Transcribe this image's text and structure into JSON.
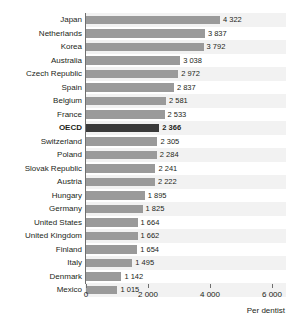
{
  "chart_data": {
    "type": "bar",
    "orientation": "horizontal",
    "title": "",
    "subtitle": "",
    "xlabel": "Per dentist",
    "ylabel": "",
    "xlim": [
      0,
      6000
    ],
    "xticks": [
      0,
      2000,
      4000,
      6000
    ],
    "xtick_labels": [
      "0",
      "2 000",
      "4 000",
      "6 000"
    ],
    "grid": false,
    "legend": null,
    "highlight_category": "OECD",
    "highlight_color": "#3a3a3a",
    "bar_color": "#9a9a9a",
    "band_color": "#f2f2f2",
    "categories": [
      "Japan",
      "Netherlands",
      "Korea",
      "Australia",
      "Czech Republic",
      "Spain",
      "Belgium",
      "France",
      "OECD",
      "Switzerland",
      "Poland",
      "Slovak Republic",
      "Austria",
      "Hungary",
      "Germany",
      "United States",
      "United Kingdom",
      "Finland",
      "Italy",
      "Denmark",
      "Mexico"
    ],
    "values": [
      4322,
      3837,
      3792,
      3038,
      2972,
      2837,
      2581,
      2533,
      2366,
      2305,
      2284,
      2241,
      2222,
      1895,
      1825,
      1664,
      1662,
      1654,
      1495,
      1142,
      1015
    ],
    "value_labels": [
      "4 322",
      "3 837",
      "3 792",
      "3 038",
      "2 972",
      "2 837",
      "2 581",
      "2 533",
      "2 366",
      "2 305",
      "2 284",
      "2 241",
      "2 222",
      "1 895",
      "1 825",
      "1 664",
      "1 662",
      "1 654",
      "1 495",
      "1 142",
      "1 015"
    ]
  }
}
